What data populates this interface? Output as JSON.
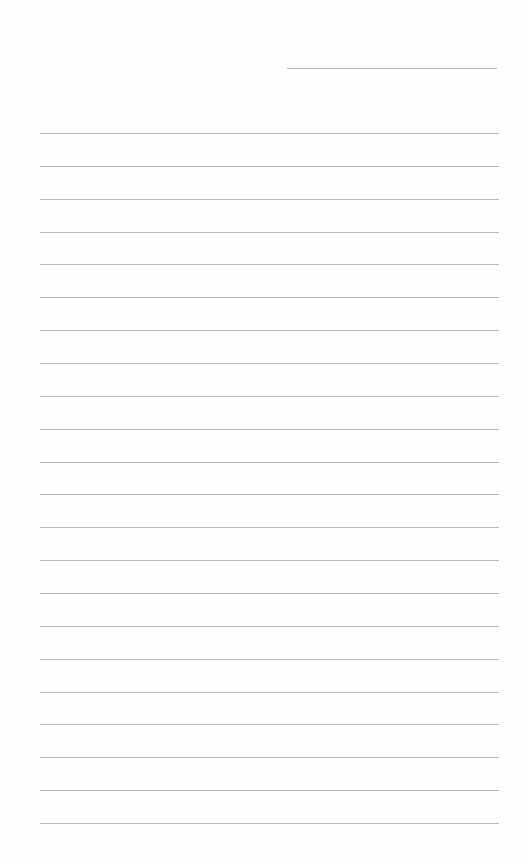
{
  "document": {
    "type": "lined-paper",
    "background_color": "#fefefe",
    "line_color": "#b8b8b8",
    "header_line": {
      "label": ""
    },
    "ruled_lines_count": 22,
    "ruled_lines": [
      {
        "text": ""
      },
      {
        "text": ""
      },
      {
        "text": ""
      },
      {
        "text": ""
      },
      {
        "text": ""
      },
      {
        "text": ""
      },
      {
        "text": ""
      },
      {
        "text": ""
      },
      {
        "text": ""
      },
      {
        "text": ""
      },
      {
        "text": ""
      },
      {
        "text": ""
      },
      {
        "text": ""
      },
      {
        "text": ""
      },
      {
        "text": ""
      },
      {
        "text": ""
      },
      {
        "text": ""
      },
      {
        "text": ""
      },
      {
        "text": ""
      },
      {
        "text": ""
      },
      {
        "text": ""
      },
      {
        "text": ""
      }
    ]
  }
}
